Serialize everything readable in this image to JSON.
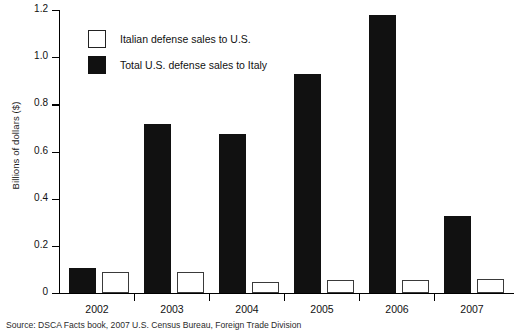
{
  "chart_data": {
    "type": "bar",
    "title": "",
    "subtitle": "",
    "xlabel": "",
    "ylabel": "Billions of dollars ($)",
    "categories": [
      "2002",
      "2003",
      "2004",
      "2005",
      "2006",
      "2007"
    ],
    "ylim": [
      0,
      1.2
    ],
    "yticks": [
      "0",
      "0.2",
      "0.4",
      "0.6",
      "0.8",
      "1.0",
      "1.2"
    ],
    "ytick_values": [
      0,
      0.2,
      0.4,
      0.6,
      0.8,
      1.0,
      1.2
    ],
    "grid": false,
    "legend_position": "top-left-inside",
    "series": [
      {
        "name": "Italian defense sales to U.S.",
        "style": "white-fill-black-outline",
        "color": "#ffffff",
        "edge_color": "#3a3a3a",
        "values": [
          0.09,
          0.09,
          0.045,
          0.055,
          0.055,
          0.06
        ]
      },
      {
        "name": "Total U.S. defense sales to Italy",
        "style": "black-fill",
        "color": "#111111",
        "edge_color": "#111111",
        "values": [
          0.105,
          0.715,
          0.675,
          0.93,
          1.18,
          0.325
        ]
      }
    ],
    "annotations": []
  },
  "axis": {
    "y_title": "Billions of dollars ($)",
    "y_tick_labels": [
      "1.2",
      "1.0",
      "0.8",
      "0.6",
      "0.4",
      "0.2",
      "0"
    ],
    "x_tick_labels": [
      "2002",
      "2003",
      "2004",
      "2005",
      "2006",
      "2007"
    ]
  },
  "legend": {
    "items": [
      {
        "label": "Italian defense sales to U.S.",
        "swatch": "white-square-swatch"
      },
      {
        "label": "Total U.S. defense sales to Italy",
        "swatch": "black-square-swatch"
      }
    ]
  },
  "footer": {
    "source": "Source: DSCA Facts book, 2007 U.S. Census Bureau, Foreign Trade Division"
  }
}
